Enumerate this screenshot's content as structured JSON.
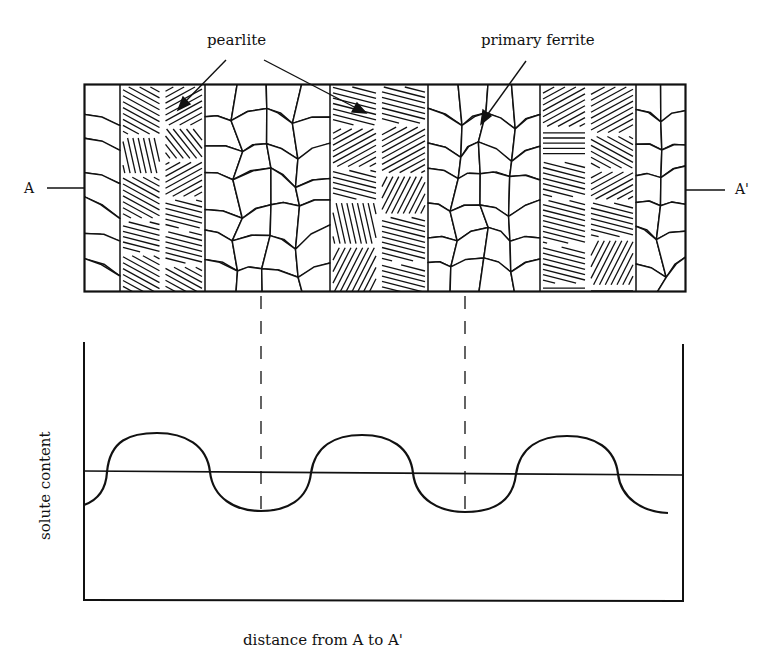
{
  "figure": {
    "labels": {
      "pearlite": "pearlite",
      "primary_ferrite": "primary ferrite",
      "section_start": "A",
      "section_end": "A'",
      "y_axis": "solute content",
      "x_axis": "distance from A to A'"
    },
    "micrograph": {
      "description": "Banded microstructure: alternating bands of primary ferrite (polygonal grains) and pearlite (lamellar hatching)",
      "bands": [
        {
          "phase": "primary ferrite",
          "x_from": 84,
          "x_to": 120
        },
        {
          "phase": "pearlite",
          "x_from": 120,
          "x_to": 205
        },
        {
          "phase": "primary ferrite",
          "x_from": 205,
          "x_to": 330
        },
        {
          "phase": "pearlite",
          "x_from": 330,
          "x_to": 428
        },
        {
          "phase": "primary ferrite",
          "x_from": 428,
          "x_to": 540
        },
        {
          "phase": "pearlite",
          "x_from": 540,
          "x_to": 636
        },
        {
          "phase": "primary ferrite",
          "x_from": 636,
          "x_to": 686
        }
      ]
    },
    "colors": {
      "ink": "#111111",
      "background": "#ffffff"
    }
  },
  "chart_data": {
    "type": "line",
    "title": "",
    "xlabel": "distance from A to A'",
    "ylabel": "solute content",
    "grid": false,
    "legend": "none",
    "axis_ticks": "none",
    "baseline": "horizontal reference line at mean solute content",
    "series": [
      {
        "name": "solute content profile",
        "shape": "periodic square-ish wave: high in pearlite bands, low in primary ferrite bands",
        "x": [
          0.0,
          0.04,
          0.21,
          0.38,
          0.55,
          0.72,
          0.89,
          0.98
        ],
        "y": [
          -0.5,
          0.0,
          1.0,
          0.0,
          -1.0,
          0.0,
          1.0,
          -1.0
        ],
        "peaks_x": [
          0.21,
          0.55,
          0.89
        ],
        "troughs_x": [
          0.3,
          0.64,
          0.98
        ],
        "note": "troughs align with centers of primary ferrite bands (dashed projection lines)"
      }
    ],
    "projection_lines": [
      {
        "from": "primary ferrite band center",
        "style": "dashed",
        "x_px": 261
      },
      {
        "from": "primary ferrite band center",
        "style": "dashed",
        "x_px": 465
      }
    ]
  }
}
